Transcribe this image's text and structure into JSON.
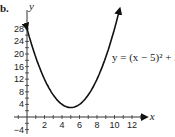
{
  "problem_label": "b.",
  "chart_data": {
    "type": "line",
    "title": "",
    "function": "y = (x - 5)^2 + 3",
    "equation_label": "y = (x − 5)² + 3",
    "xlabel": "x",
    "ylabel": "y",
    "x_ticks": [
      2,
      4,
      6,
      8,
      10,
      12
    ],
    "y_ticks": [
      -4,
      4,
      8,
      12,
      16,
      20,
      24,
      28
    ],
    "xlim": [
      -1,
      13
    ],
    "ylim": [
      -6,
      32
    ],
    "grid": false,
    "vertex": [
      5,
      3
    ],
    "series": [
      {
        "name": "y = (x − 5)² + 3",
        "x": [
          0,
          1,
          2,
          3,
          4,
          5,
          6,
          7,
          8,
          9,
          10,
          10.6
        ],
        "values": [
          28,
          19,
          12,
          7,
          4,
          3,
          4,
          7,
          12,
          19,
          28,
          34.4
        ]
      }
    ],
    "arrows_at_ends": true
  },
  "axis": {
    "x_label": "x",
    "y_label": "y",
    "x_tick_labels": [
      "2",
      "4",
      "6",
      "8",
      "10",
      "12"
    ],
    "y_tick_labels": [
      "28",
      "24",
      "20",
      "16",
      "12",
      "8",
      "4",
      "−4"
    ]
  }
}
